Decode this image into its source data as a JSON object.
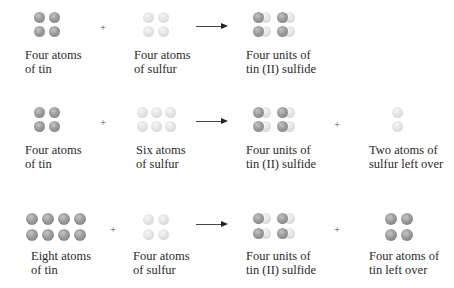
{
  "rows": [
    {
      "reactant1": {
        "label_line1": "Four atoms",
        "label_line2": "of tin",
        "atom": "tin",
        "count": 4
      },
      "operator1": "+",
      "reactant2": {
        "label_line1": "Four atoms",
        "label_line2": "of sulfur",
        "atom": "sulfur",
        "count": 4
      },
      "arrow": "reaction-arrow",
      "product": {
        "label_line1": "Four units of",
        "label_line2": "tin (II) sulfide",
        "atom": "tin-sulfide",
        "count": 4
      }
    },
    {
      "reactant1": {
        "label_line1": "Four atoms",
        "label_line2": "of tin",
        "atom": "tin",
        "count": 4
      },
      "operator1": "+",
      "reactant2": {
        "label_line1": "Six atoms",
        "label_line2": "of sulfur",
        "atom": "sulfur",
        "count": 6
      },
      "arrow": "reaction-arrow",
      "product": {
        "label_line1": "Four units of",
        "label_line2": "tin (II) sulfide",
        "atom": "tin-sulfide",
        "count": 4
      },
      "operator2": "+",
      "leftover": {
        "label_line1": "Two atoms of",
        "label_line2": "sulfur left over",
        "atom": "sulfur",
        "count": 2
      }
    },
    {
      "reactant1": {
        "label_line1": "Eight atoms",
        "label_line2": "of tin",
        "atom": "tin",
        "count": 8
      },
      "operator1": "+",
      "reactant2": {
        "label_line1": "Four atoms",
        "label_line2": "of sulfur",
        "atom": "sulfur",
        "count": 4
      },
      "arrow": "reaction-arrow",
      "product": {
        "label_line1": "Four units of",
        "label_line2": "tin (II) sulfide",
        "atom": "tin-sulfide",
        "count": 4
      },
      "operator2": "+",
      "leftover": {
        "label_line1": "Four atoms of",
        "label_line2": "tin left over",
        "atom": "tin",
        "count": 4
      }
    }
  ],
  "colors": {
    "tin": "#8f8f8f",
    "sulfur": "#e0e0e0",
    "text": "#2a2a2a"
  }
}
